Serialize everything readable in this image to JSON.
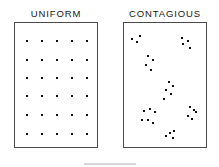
{
  "figure": {
    "width": 219,
    "height": 167,
    "background_color": "#ffffff",
    "dot_color": "#111111",
    "frame_color": "#4a4a4a",
    "title_color": "#171717"
  },
  "panels": [
    {
      "id": "uniform",
      "title": "UNIFORM",
      "box": {
        "x": 14,
        "y": 22,
        "width": 84,
        "height": 126
      },
      "title_x": 14,
      "title_y": 8,
      "title_width": 84
    },
    {
      "id": "contagious",
      "title": "CONTAGIOUS",
      "box": {
        "x": 123,
        "y": 22,
        "width": 84,
        "height": 126
      },
      "title_x": 121,
      "title_y": 8,
      "title_width": 88
    }
  ],
  "chart_data": [
    {
      "type": "scatter",
      "title": "UNIFORM",
      "xlabel": "",
      "ylabel": "",
      "xlim": [
        0,
        100
      ],
      "ylim": [
        0,
        100
      ],
      "grid": false,
      "legend": "none",
      "annotation": "Regular lattice arrangement of points: 5 columns by 6 rows, evenly spaced",
      "n_points": 30,
      "series": [
        {
          "name": "uniform points",
          "marker": "square",
          "color": "#111111",
          "x": [
            14,
            32,
            50,
            68,
            86,
            14,
            32,
            50,
            68,
            86,
            14,
            32,
            50,
            68,
            86,
            14,
            32,
            50,
            68,
            86,
            14,
            32,
            50,
            68,
            86,
            14,
            32,
            50,
            68,
            86
          ],
          "y": [
            86,
            86,
            86,
            86,
            86,
            71,
            71,
            71,
            71,
            71,
            56,
            56,
            56,
            56,
            56,
            42,
            42,
            42,
            42,
            42,
            27,
            27,
            27,
            27,
            27,
            12,
            12,
            12,
            12,
            12
          ]
        }
      ]
    },
    {
      "type": "scatter",
      "title": "CONTAGIOUS",
      "xlabel": "",
      "ylabel": "",
      "xlim": [
        0,
        100
      ],
      "ylim": [
        0,
        100
      ],
      "grid": false,
      "legend": "none",
      "annotation": "Clustered (contagious) arrangement of points: seven aggregated clumps scattered across the frame",
      "n_points": 31,
      "series": [
        {
          "name": "contagious points",
          "marker": "square",
          "color": "#111111",
          "x": [
            10,
            15,
            19,
            69,
            76,
            70,
            78,
            29,
            34,
            26,
            32,
            54,
            58,
            50,
            56,
            48,
            24,
            31,
            37,
            21,
            29,
            34,
            78,
            83,
            76,
            81,
            86,
            55,
            60,
            50,
            58
          ],
          "y": [
            87,
            85,
            90,
            88,
            86,
            83,
            80,
            74,
            71,
            67,
            63,
            53,
            50,
            47,
            44,
            40,
            30,
            32,
            29,
            23,
            23,
            21,
            33,
            31,
            26,
            24,
            29,
            13,
            14,
            10,
            9
          ]
        }
      ],
      "clusters": [
        {
          "name": "top-left",
          "count": 3
        },
        {
          "name": "top-right",
          "count": 4
        },
        {
          "name": "upper-middle-left",
          "count": 4
        },
        {
          "name": "center",
          "count": 5
        },
        {
          "name": "lower-left",
          "count": 6
        },
        {
          "name": "lower-right",
          "count": 5
        },
        {
          "name": "bottom-center",
          "count": 4
        }
      ]
    }
  ]
}
